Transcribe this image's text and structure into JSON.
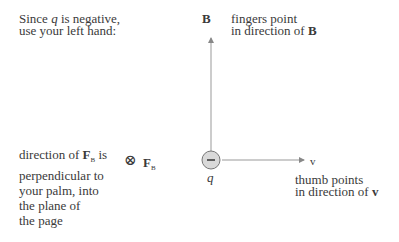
{
  "intro": {
    "line1_prefix": "Since ",
    "line1_var": "q",
    "line1_suffix": " is negative,",
    "line2": "use your left hand:"
  },
  "b_axis": {
    "label": "B"
  },
  "fingers": {
    "line1": "fingers point",
    "line2_prefix": "in direction of ",
    "line2_bold": "B"
  },
  "force": {
    "line1_prefix": "direction of ",
    "line1_bold": "F",
    "line1_sub": "B",
    "line1_suffix": " is",
    "line2": "perpendicular to",
    "line3": "your palm, into",
    "line4": "the plane of",
    "line5": "the page",
    "symbol": "⊗",
    "symbol_label": "F",
    "symbol_sub": "B"
  },
  "charge": {
    "sign": "−",
    "label": "q",
    "fill": "#d9d9d9"
  },
  "v_axis": {
    "label": "v"
  },
  "thumb": {
    "line1": "thumb points",
    "line2_prefix": "in direction of ",
    "line2_bold": "v"
  },
  "colors": {
    "line": "#888888",
    "text": "#3a3a3a"
  }
}
